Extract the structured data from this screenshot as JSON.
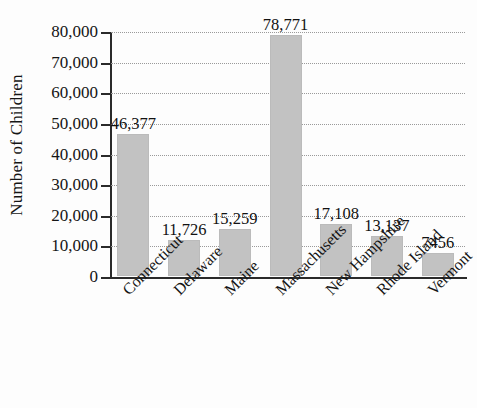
{
  "chart_data": {
    "type": "bar",
    "title": "",
    "xlabel": "",
    "ylabel": "Number of Children",
    "ylim": [
      0,
      80000
    ],
    "ytick_labels": [
      "80,000",
      "70,000",
      "60,000",
      "50,000",
      "40,000",
      "30,000",
      "20,000",
      "10,000",
      "0"
    ],
    "ytick_values": [
      80000,
      70000,
      60000,
      50000,
      40000,
      30000,
      20000,
      10000,
      0
    ],
    "grid": true,
    "legend": false,
    "bar_color": "#c2c2c2",
    "categories": [
      "Connecticut",
      "Delaware",
      "Maine",
      "Massachusetts",
      "New Hampshire",
      "Rhode Island",
      "Vermont"
    ],
    "values": [
      46377,
      11726,
      15259,
      78771,
      17108,
      13137,
      7456
    ],
    "value_labels": [
      "46,377",
      "11,726",
      "15,259",
      "78,771",
      "17,108",
      "13,137",
      "7456"
    ]
  }
}
